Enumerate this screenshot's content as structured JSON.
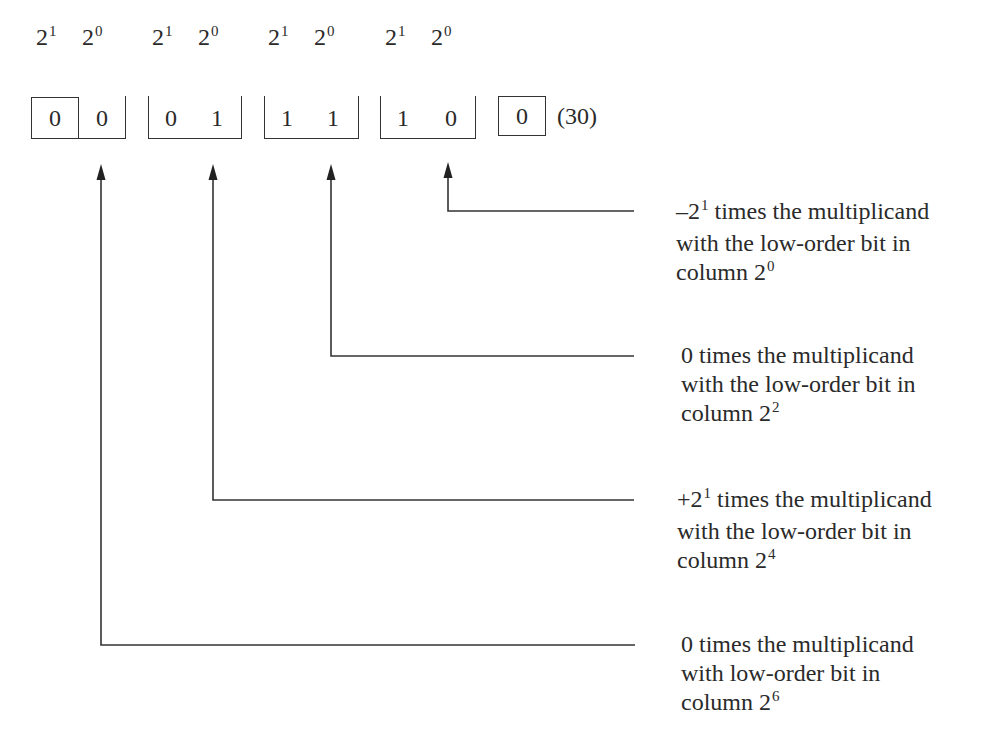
{
  "diagram": {
    "header_labels": [
      {
        "base": "2",
        "exp": "1"
      },
      {
        "base": "2",
        "exp": "0"
      },
      {
        "base": "2",
        "exp": "1"
      },
      {
        "base": "2",
        "exp": "0"
      },
      {
        "base": "2",
        "exp": "1"
      },
      {
        "base": "2",
        "exp": "0"
      },
      {
        "base": "2",
        "exp": "1"
      },
      {
        "base": "2",
        "exp": "0"
      }
    ],
    "bit_groups": [
      {
        "bits": [
          "0",
          "0"
        ]
      },
      {
        "bits": [
          "0",
          "1"
        ]
      },
      {
        "bits": [
          "1",
          "1"
        ]
      },
      {
        "bits": [
          "1",
          "0"
        ]
      }
    ],
    "appended_bit": "0",
    "value_label": "(30)",
    "annotations": [
      {
        "prefix": "–2",
        "prefix_exp": "1",
        "line1_rest": " times the multiplicand",
        "line2": "with the low-order bit in",
        "line3_base": "column 2",
        "line3_exp": "0"
      },
      {
        "prefix": "0",
        "prefix_exp": "",
        "line1_rest": " times the multiplicand",
        "line2": "with the low-order bit in",
        "line3_base": "column 2",
        "line3_exp": "2"
      },
      {
        "prefix": "+2",
        "prefix_exp": "1",
        "line1_rest": " times the multiplicand",
        "line2": "with the low-order bit in",
        "line3_base": "column 2",
        "line3_exp": "4"
      },
      {
        "prefix": "0",
        "prefix_exp": "",
        "line1_rest": " times the multiplicand",
        "line2": "with low-order bit in",
        "line3_base": "column 2",
        "line3_exp": "6"
      }
    ]
  }
}
